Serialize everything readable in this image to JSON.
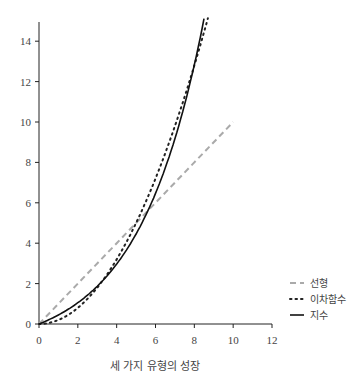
{
  "chart_data": {
    "type": "line",
    "title": "",
    "caption": "세 가지 유형의 성장",
    "xlabel": "",
    "ylabel": "",
    "xlim": [
      0,
      12
    ],
    "ylim": [
      0,
      15
    ],
    "xticks": [
      0,
      2,
      4,
      6,
      8,
      10,
      12
    ],
    "yticks": [
      0,
      2,
      4,
      6,
      8,
      10,
      12,
      14
    ],
    "grid": false,
    "legend_position": "right",
    "series": [
      {
        "name": "선형",
        "style": "dashed",
        "color": "#aaaaaa",
        "x": [
          0,
          2,
          4,
          6,
          8,
          10
        ],
        "y": [
          0,
          2,
          4,
          6,
          8,
          10
        ]
      },
      {
        "name": "이차함수",
        "style": "dotted",
        "color": "#222222",
        "x": [
          0,
          1,
          2,
          3,
          4,
          5,
          6,
          7,
          8,
          8.7
        ],
        "y": [
          0,
          0.2,
          0.8,
          1.8,
          3.2,
          5.0,
          7.2,
          9.8,
          12.8,
          15.1
        ]
      },
      {
        "name": "지수",
        "style": "solid",
        "color": "#111111",
        "x": [
          0,
          1,
          2,
          3,
          4,
          5,
          6,
          7,
          8,
          8.5
        ],
        "y": [
          0,
          0.45,
          1.06,
          1.88,
          2.96,
          4.45,
          6.43,
          9.15,
          12.8,
          15.0
        ]
      }
    ]
  }
}
